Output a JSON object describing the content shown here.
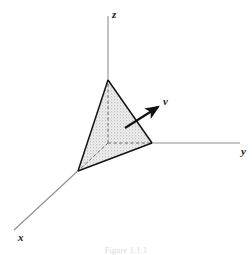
{
  "figure": {
    "type": "3d-geometry-diagram",
    "background_color": "#ffffff",
    "line_color": "#1a1a1a",
    "axis_color": "#8a8a8a",
    "shade_fill": "#d9d9d9",
    "shade_style": "stipple",
    "axes": [
      {
        "id": "z",
        "label": "z",
        "label_x": 112,
        "label_y": 18,
        "from": {
          "x": 108,
          "y": 143
        },
        "to": {
          "x": 108,
          "y": 16
        }
      },
      {
        "id": "y",
        "label": "y",
        "label_x": 241,
        "label_y": 155,
        "from": {
          "x": 108,
          "y": 143
        },
        "to": {
          "x": 240,
          "y": 143
        }
      },
      {
        "id": "x",
        "label": "x",
        "label_x": 18,
        "label_y": 241,
        "from": {
          "x": 108,
          "y": 143
        },
        "to": {
          "x": 14,
          "y": 230
        }
      }
    ],
    "origin": {
      "x": 108,
      "y": 143
    },
    "tetrahedron": {
      "vertices": {
        "apex_z": {
          "x": 108,
          "y": 80
        },
        "front_x": {
          "x": 78,
          "y": 171
        },
        "right_y": {
          "x": 152,
          "y": 143
        },
        "origin": {
          "x": 108,
          "y": 143
        }
      },
      "solid_edges": [
        "apex_z-front_x",
        "apex_z-right_y",
        "front_x-right_y"
      ],
      "hidden_edges": [
        "origin-apex_z",
        "origin-front_x",
        "origin-right_y"
      ],
      "hidden_edge_style": "dashed"
    },
    "normal_vector": {
      "label": "ν",
      "label_x": 166,
      "label_y": 105,
      "tail": {
        "x": 125,
        "y": 128
      },
      "head": {
        "x": 161,
        "y": 105
      },
      "arrow_style": "solid-filled-head"
    },
    "caption": "Figure 1.1.1"
  }
}
